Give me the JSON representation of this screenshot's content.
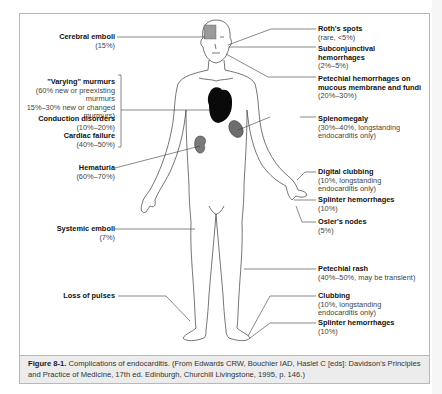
{
  "figure": {
    "labels_left": [
      {
        "id": "cerebral-emboli",
        "title": "Cerebral emboli",
        "detail": [
          "(15%)"
        ]
      },
      {
        "id": "varying-murmurs",
        "title": "\"Varying\" murmurs",
        "detail": [
          "(60% new or preexisting",
          "murmurs",
          "15%–30% new or changed",
          "murmurs)"
        ]
      },
      {
        "id": "conduction-disorders",
        "title": "Conduction disorders",
        "detail": [
          "(10%–20%)"
        ]
      },
      {
        "id": "cardiac-failure",
        "title": "Cardiac failure",
        "detail": [
          "(40%–50%)"
        ]
      },
      {
        "id": "hematuria",
        "title": "Hematuria",
        "detail": [
          "(60%–70%)"
        ]
      },
      {
        "id": "systemic-emboli",
        "title": "Systemic emboli",
        "detail": [
          "(7%)"
        ]
      },
      {
        "id": "loss-of-pulses",
        "title": "Loss of pulses",
        "detail": []
      }
    ],
    "labels_right": [
      {
        "id": "roths-spots",
        "title": "Roth's spots",
        "detail": [
          "(rare, <5%)"
        ]
      },
      {
        "id": "subconjunctival-hemorrhages",
        "title": "Subconjunctival",
        "title2": "hemorrhages",
        "detail": [
          "(2%–5%)"
        ]
      },
      {
        "id": "petechial-hemorrhages",
        "title": "Petechial hemorrhages on",
        "title2": "mucous membrane and fundi",
        "detail": [
          "(20%–30%)"
        ]
      },
      {
        "id": "splenomegaly",
        "title": "Splenomegaly",
        "detail": [
          "(30%–40%, longstanding",
          "endocarditis only)"
        ]
      },
      {
        "id": "digital-clubbing",
        "title": "Digital clubbing",
        "detail": [
          "(10%, longstanding",
          "endocarditis only)"
        ]
      },
      {
        "id": "splinter-hemorrhages-hand",
        "title": "Splinter hemorrhages",
        "detail": [
          "(10%)"
        ]
      },
      {
        "id": "oslers-nodes",
        "title": "Osler's nodes",
        "detail": [
          "(5%)"
        ]
      },
      {
        "id": "petechial-rash",
        "title": "Petechial rash",
        "detail": [
          "(40%–50%, may be transient)"
        ]
      },
      {
        "id": "clubbing",
        "title": "Clubbing",
        "detail": [
          "(10%, longstanding",
          "endocarditis only)"
        ]
      },
      {
        "id": "splinter-hemorrhages-foot",
        "title": "Splinter hemorrhages",
        "detail": [
          "(10%)"
        ]
      }
    ]
  },
  "caption": {
    "label": "Figure 8-1.",
    "text": " Complications of endocarditis. (From Edwards CRW, Bouchier IAD, Haslet C [eds]: Davidson's Principles and Practice of Medicine, 17th ed. Edinburgh, Churchill Livingstone, 1995, p. 146.)"
  }
}
